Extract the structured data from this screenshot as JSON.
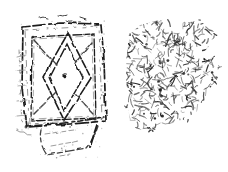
{
  "canvas": {
    "width": 228,
    "height": 172,
    "background_color": "#ffffff"
  },
  "drawing": {
    "ink_dark": "#1c1c1c",
    "ink_mid": "#424242",
    "ink_light": "#929292",
    "items": {
      "left": "stamp-seal-face-with-lozenge-motif",
      "separator": "short-dash",
      "right": "textured-reverse-fragment"
    },
    "texture": {
      "seed": 12,
      "squiggle_count": 440,
      "blob_count": 26,
      "edge_stroke_count": 26,
      "speckle_count": 95
    }
  }
}
